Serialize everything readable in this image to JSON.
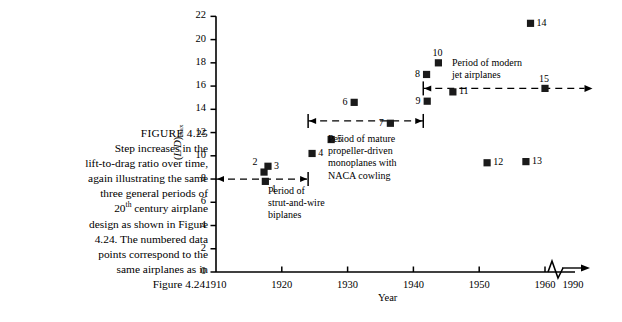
{
  "caption": {
    "figure_number": "FIGURE 4.25",
    "lines": [
      "Step increases in the",
      "lift-to-drag ratio over time,",
      "again illustrating the same",
      "three general periods of",
      "20th century airplane",
      "design as shown in Figure",
      "4.24. The numbered data",
      "points correspond to the",
      "same airplanes as in",
      "Figure 4.24."
    ],
    "superscript_line_prefix": "20",
    "superscript": "th",
    "superscript_line_suffix": " century airplane"
  },
  "chart_data": {
    "type": "scatter",
    "title": "",
    "xlabel": "Year",
    "ylabel": "(L/D)max",
    "ylabel_parts": {
      "base": "(L/D)",
      "sub": "max"
    },
    "xlim": [
      1910,
      1965
    ],
    "ylim": [
      0,
      22
    ],
    "ytick_step": 2,
    "yticks": [
      0,
      2,
      4,
      6,
      8,
      10,
      12,
      14,
      16,
      18,
      20,
      22
    ],
    "xticks": [
      1910,
      1920,
      1930,
      1940,
      1950,
      1960
    ],
    "xtick_broken": 1990,
    "axis_break": true,
    "grid": false,
    "legend": "none",
    "points": [
      {
        "label": "1",
        "x": 1917.5,
        "y": 7.8,
        "lx": "right",
        "ly": "below"
      },
      {
        "label": "2",
        "x": 1917.3,
        "y": 8.6,
        "lx": "left",
        "ly": "above"
      },
      {
        "label": "3",
        "x": 1917.9,
        "y": 9.1,
        "lx": "right",
        "ly": "mid"
      },
      {
        "label": "4",
        "x": 1924.6,
        "y": 10.2,
        "lx": "right",
        "ly": "mid"
      },
      {
        "label": "5",
        "x": 1927.5,
        "y": 11.4,
        "lx": "right",
        "ly": "mid"
      },
      {
        "label": "6",
        "x": 1931.0,
        "y": 14.6,
        "lx": "left",
        "ly": "mid"
      },
      {
        "label": "7",
        "x": 1936.5,
        "y": 12.8,
        "lx": "left",
        "ly": "mid"
      },
      {
        "label": "8",
        "x": 1942.0,
        "y": 17.0,
        "lx": "left",
        "ly": "mid"
      },
      {
        "label": "9",
        "x": 1942.1,
        "y": 14.7,
        "lx": "left",
        "ly": "mid"
      },
      {
        "label": "10",
        "x": 1943.8,
        "y": 18.0,
        "lx": "center",
        "ly": "above"
      },
      {
        "label": "11",
        "x": 1946.0,
        "y": 15.5,
        "lx": "right",
        "ly": "mid"
      },
      {
        "label": "12",
        "x": 1951.2,
        "y": 9.4,
        "lx": "right",
        "ly": "mid"
      },
      {
        "label": "13",
        "x": 1957.1,
        "y": 9.5,
        "lx": "right",
        "ly": "mid"
      },
      {
        "label": "14",
        "x": 1957.8,
        "y": 21.4,
        "lx": "right",
        "ly": "mid"
      },
      {
        "label": "15",
        "x": 1960.0,
        "y": 15.8,
        "lx": "center",
        "ly": "above"
      }
    ],
    "annotations": [
      {
        "id": "period-biplanes",
        "lines": [
          "Period of",
          "strut-and-wire",
          "biplanes"
        ],
        "bar_y": 8.0,
        "bar_x_start": 1910.0,
        "bar_x_end": 1924.0,
        "cap": "right"
      },
      {
        "id": "period-propeller",
        "lines": [
          "Period of mature",
          "propeller-driven",
          "monoplanes with",
          "NACA cowling"
        ],
        "bar_y": 13.0,
        "bar_x_start": 1924.0,
        "bar_x_end": 1941.5,
        "cap": "both"
      },
      {
        "id": "period-jet",
        "lines": [
          "Period of modern",
          "jet airplanes"
        ],
        "bar_y": 15.8,
        "bar_x_start": 1941.5,
        "bar_x_end": 1966.0,
        "cap": "left-arrow-right"
      }
    ]
  },
  "colors": {
    "ink": "#000000",
    "marker": "#1a1a1a",
    "background": "#ffffff"
  }
}
